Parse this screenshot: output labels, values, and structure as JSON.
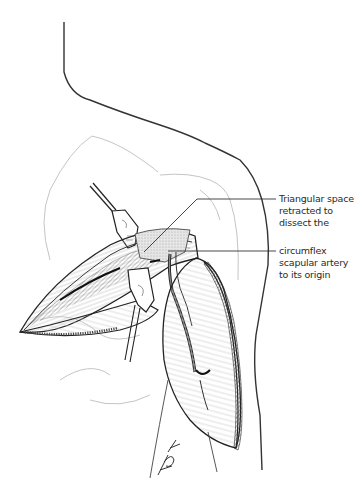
{
  "figure": {
    "type": "surgical-illustration",
    "line_color": "#2a2a2a",
    "background": "#ffffff"
  },
  "annotations": [
    {
      "id": "triangular-space",
      "text": "Triangular space\nretracted to\ndissect the"
    },
    {
      "id": "circumflex-artery",
      "text": "circumflex\nscapular artery\nto its origin"
    }
  ],
  "signature": {
    "text": "KGK"
  }
}
